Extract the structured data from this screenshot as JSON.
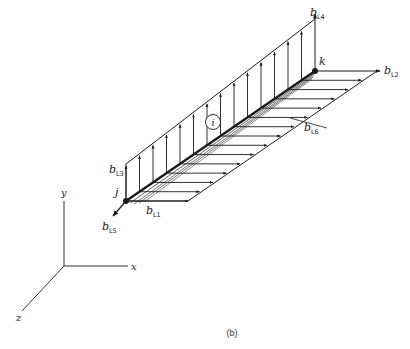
{
  "figure": {
    "caption": "(b)"
  },
  "nodes": {
    "j": {
      "label": "j",
      "x": 126,
      "y": 201
    },
    "k": {
      "label": "k",
      "x": 315,
      "y": 71
    }
  },
  "element": {
    "label": "i"
  },
  "load_labels": {
    "bL1": {
      "base": "b",
      "sub": "L1"
    },
    "bL2": {
      "base": "b",
      "sub": "L2"
    },
    "bL3": {
      "base": "b",
      "sub": "L3"
    },
    "bL4": {
      "base": "b",
      "sub": "L4"
    },
    "bL5": {
      "base": "b",
      "sub": "L5"
    },
    "bL6": {
      "base": "b",
      "sub": "L6"
    }
  },
  "axes": {
    "x": "x",
    "y": "y",
    "z": "z"
  },
  "colors": {
    "ink": "#1a1a1a",
    "background": "#ffffff"
  }
}
